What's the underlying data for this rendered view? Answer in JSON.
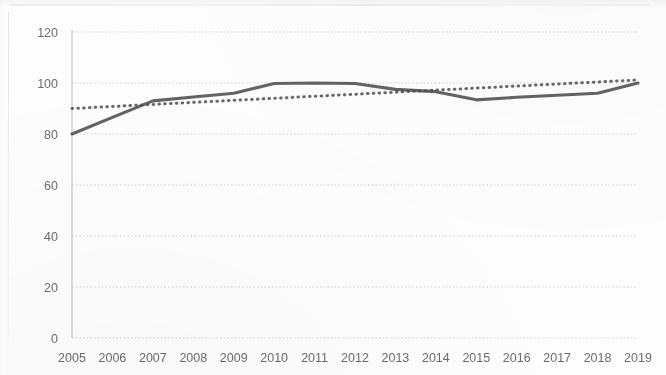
{
  "chart_data": {
    "type": "line",
    "title": "",
    "subtitle": "",
    "xlabel": "",
    "ylabel": "",
    "grid": true,
    "legend_position": "none",
    "x": [
      2005,
      2006,
      2007,
      2008,
      2009,
      2010,
      2011,
      2012,
      2013,
      2014,
      2015,
      2016,
      2017,
      2018,
      2019
    ],
    "categories": [
      "2005",
      "2006",
      "2007",
      "2008",
      "2009",
      "2010",
      "2011",
      "2012",
      "2013",
      "2014",
      "2015",
      "2016",
      "2017",
      "2018",
      "2019"
    ],
    "ylim": [
      0,
      120
    ],
    "ytick_values": [
      0,
      20,
      40,
      60,
      80,
      100,
      120
    ],
    "ytick_labels": [
      "0",
      "20",
      "40",
      "60",
      "80",
      "100",
      "120"
    ],
    "series": [
      {
        "name": "index",
        "style": "solid",
        "color": "#565656",
        "values": [
          80.0,
          86.5,
          93.0,
          94.5,
          96.0,
          99.8,
          100.0,
          99.8,
          97.5,
          96.6,
          93.4,
          94.4,
          95.2,
          96.0,
          100.0
        ]
      },
      {
        "name": "trendline",
        "style": "dotted",
        "color": "#4d4d4d",
        "values": [
          90.0,
          90.8,
          91.6,
          92.4,
          93.2,
          94.0,
          94.8,
          95.6,
          96.4,
          97.2,
          98.0,
          98.8,
          99.6,
          100.4,
          101.2
        ]
      }
    ]
  },
  "axes": {
    "y_axis_name": "value-axis",
    "x_axis_name": "year-axis"
  }
}
